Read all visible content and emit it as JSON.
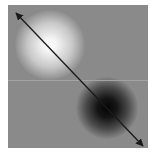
{
  "figure": {
    "background_color": "#8a8a8a",
    "panel": {
      "x": 8,
      "y": 5,
      "width": 140,
      "height": 143
    },
    "bright_spot": {
      "cx": 50,
      "cy": 45,
      "color": "#ffffff",
      "label": ""
    },
    "dark_spot": {
      "cx": 107,
      "cy": 108,
      "color": "#050505",
      "label": ""
    },
    "arrow": {
      "x1": 16,
      "y1": 13,
      "x2": 143,
      "y2": 146,
      "style": "double-headed",
      "color": "#1a1a1a"
    },
    "seam_line_y": 80
  }
}
